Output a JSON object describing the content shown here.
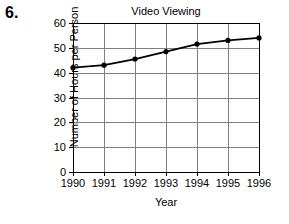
{
  "problem": {
    "number": "6."
  },
  "chart_data": {
    "type": "line",
    "title": "Video Viewing",
    "xlabel": "Year",
    "ylabel": "Number of Hours per Person",
    "categories": [
      "1990",
      "1991",
      "1992",
      "1993",
      "1994",
      "1995",
      "1996"
    ],
    "values": [
      42,
      43,
      45.5,
      48.5,
      51.5,
      53,
      54
    ],
    "x_tick_labels": [
      "1990",
      "1991",
      "1992",
      "1993",
      "1994",
      "1995",
      "1996"
    ],
    "y_tick_labels": [
      "0",
      "10",
      "20",
      "30",
      "40",
      "50",
      "60"
    ],
    "y_ticks": [
      0,
      10,
      20,
      30,
      40,
      50,
      60
    ],
    "ylim": [
      0,
      60
    ],
    "xlim": [
      1990,
      1996
    ],
    "grid": true,
    "legend": "none",
    "marker": "filled-circle",
    "line_color": "#000000",
    "grid_color": "#808080",
    "axis_color": "#000000",
    "background_color": "#ffffff"
  }
}
